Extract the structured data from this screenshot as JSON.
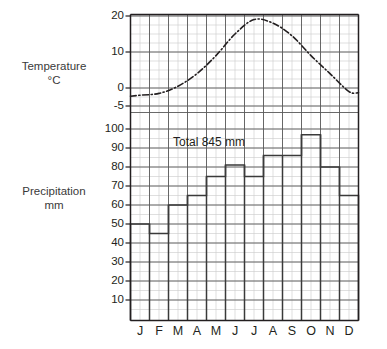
{
  "labels": {
    "temperature_axis": "Temperature",
    "temperature_unit": "°C",
    "precipitation_axis": "Precipitation",
    "precipitation_unit": "mm",
    "total_annotation": "Total 845 mm"
  },
  "colors": {
    "ink": "#231f20",
    "grid_major": "#4a4a4a",
    "grid_minor": "#c9c9c9",
    "axis": "#231f20",
    "bar_outline": "#3a3a3a",
    "curve": "#231f20"
  },
  "chart_data": {
    "type": "bar",
    "title": "",
    "subtitle": "",
    "annotations": [
      "Total 845 mm"
    ],
    "categories": [
      "J",
      "F",
      "M",
      "A",
      "M",
      "J",
      "J",
      "A",
      "S",
      "O",
      "N",
      "D"
    ],
    "month_names": [
      "January",
      "February",
      "March",
      "April",
      "May",
      "June",
      "July",
      "August",
      "September",
      "October",
      "November",
      "December"
    ],
    "grid": true,
    "legend": "none",
    "series": [
      {
        "name": "Precipitation",
        "chart_type": "bar",
        "unit": "mm",
        "axis": "left-lower",
        "values": [
          50,
          45,
          60,
          65,
          75,
          81,
          75,
          86,
          86,
          97,
          80,
          65
        ],
        "total": 845
      },
      {
        "name": "Temperature",
        "chart_type": "line",
        "unit": "°C",
        "axis": "left-upper",
        "style": "dash-dot",
        "values": [
          -2,
          -1.5,
          0.5,
          4,
          9,
          15,
          19,
          18,
          14.5,
          9,
          4,
          -1
        ]
      }
    ],
    "temperature_axis": {
      "label": "Temperature °C",
      "unit": "°C",
      "ticks": [
        20,
        10,
        0,
        -5
      ],
      "tick_labels": [
        "20",
        "10",
        "0",
        "-5"
      ],
      "ylim": [
        -5,
        20
      ]
    },
    "precipitation_axis": {
      "label": "Precipitation mm",
      "unit": "mm",
      "ticks": [
        100,
        90,
        80,
        70,
        60,
        50,
        40,
        30,
        20,
        10
      ],
      "tick_labels": [
        "100",
        "90",
        "80",
        "70",
        "60",
        "50",
        "40",
        "30",
        "20",
        "10"
      ],
      "ylim": [
        0,
        105
      ]
    },
    "xlabel": "",
    "ylabel": ""
  }
}
